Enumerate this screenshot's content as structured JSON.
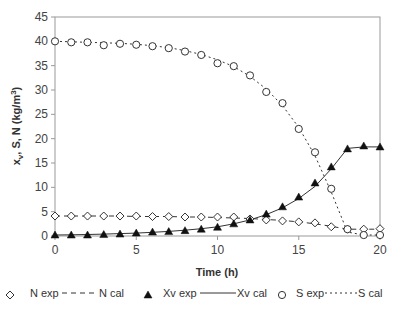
{
  "chart_data": {
    "type": "scatter",
    "title": "",
    "xlabel": "Time (h)",
    "ylabel": "xv, S, N (kg/m3)",
    "ylabel_parts": {
      "x": "x",
      "sub": "v",
      "rest": ", S, N (kg/m",
      "sup": "3",
      "close": ")"
    },
    "xlim": [
      0,
      20
    ],
    "ylim": [
      0,
      45
    ],
    "xticks": [
      0,
      5,
      10,
      15,
      20
    ],
    "yticks": [
      0,
      5,
      10,
      15,
      20,
      25,
      30,
      35,
      40,
      45
    ],
    "grid": false,
    "legend_position": "bottom",
    "x": [
      0,
      1,
      2,
      3,
      4,
      5,
      6,
      7,
      8,
      9,
      10,
      11,
      12,
      13,
      14,
      15,
      16,
      17,
      18,
      19,
      20
    ],
    "series": [
      {
        "name": "N exp",
        "kind": "marker",
        "marker": "diamond-open",
        "values": [
          4.1,
          4.1,
          4.1,
          4.1,
          4.1,
          4.1,
          4.0,
          4.0,
          3.9,
          3.9,
          3.9,
          3.9,
          3.5,
          3.3,
          3.1,
          2.9,
          2.7,
          1.9,
          1.4,
          1.4,
          1.5
        ]
      },
      {
        "name": "N cal",
        "kind": "line",
        "style": "dash",
        "values": [
          4.1,
          4.1,
          4.1,
          4.1,
          4.1,
          4.0,
          4.0,
          4.0,
          3.9,
          3.9,
          3.8,
          3.7,
          3.6,
          3.4,
          3.2,
          2.9,
          2.5,
          2.0,
          1.4,
          1.4,
          1.4
        ]
      },
      {
        "name": "Xv exp",
        "kind": "marker",
        "marker": "triangle-filled",
        "values": [
          0.2,
          0.2,
          0.2,
          0.3,
          0.4,
          0.6,
          0.8,
          0.9,
          1.1,
          1.4,
          1.8,
          2.5,
          3.3,
          4.5,
          6.0,
          8.0,
          10.9,
          14.2,
          17.9,
          18.5,
          18.3
        ]
      },
      {
        "name": "Xv cal",
        "kind": "line",
        "style": "solid",
        "values": [
          0.2,
          0.25,
          0.3,
          0.4,
          0.5,
          0.6,
          0.75,
          0.95,
          1.2,
          1.5,
          1.9,
          2.5,
          3.3,
          4.4,
          5.8,
          7.7,
          10.2,
          13.8,
          18.0,
          18.3,
          18.3
        ]
      },
      {
        "name": "S exp",
        "kind": "marker",
        "marker": "circle-open",
        "values": [
          40.0,
          39.8,
          39.8,
          39.2,
          39.5,
          39.3,
          39.0,
          38.6,
          37.9,
          37.2,
          35.5,
          34.9,
          33.0,
          29.6,
          27.3,
          22.0,
          17.2,
          9.7,
          1.4,
          0.2,
          0.2
        ]
      },
      {
        "name": "S cal",
        "kind": "line",
        "style": "dot",
        "values": [
          40.0,
          39.9,
          39.8,
          39.7,
          39.6,
          39.4,
          39.1,
          38.7,
          38.1,
          37.3,
          36.2,
          34.8,
          32.8,
          30.2,
          26.8,
          22.3,
          16.5,
          9.0,
          0.8,
          0.2,
          0.2
        ]
      }
    ]
  },
  "colors": {
    "frame": "#999999",
    "series": "#333333",
    "marker_fill": "#ffffff"
  },
  "legend": [
    {
      "label": "N exp",
      "marker": "diamond-open"
    },
    {
      "label": "N cal",
      "line": "dash"
    },
    {
      "label": "Xv exp",
      "marker": "triangle-filled"
    },
    {
      "label": "Xv cal",
      "line": "solid"
    },
    {
      "label": "S exp",
      "marker": "circle-open"
    },
    {
      "label": "S cal",
      "line": "dot"
    }
  ]
}
